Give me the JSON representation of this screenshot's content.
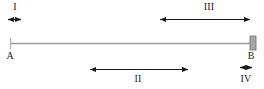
{
  "figure": {
    "type": "interval-diagram",
    "background_color": "#ffffff",
    "line_color": "#9a9a9a",
    "arrow_color": "#1a1a1a",
    "block_color": "#a8a8a8",
    "block_border_color": "#6e6e6e",
    "text_color": "#1a1a1a",
    "canvas": {
      "width": 264,
      "height": 89
    }
  },
  "rod": {
    "name": "main-rod",
    "start_label": "A",
    "end_label": "B",
    "start_x": 10,
    "end_x": 251,
    "y": 43,
    "end_block": {
      "name": "end-block",
      "x": 250,
      "y": 36,
      "width": 6,
      "height": 14
    },
    "start_tick": {
      "x": 10,
      "y_top": 38,
      "y_bottom": 49
    }
  },
  "intervals": [
    {
      "id": "I",
      "label": "I",
      "position": "above",
      "start_x": 7,
      "end_x": 22,
      "y": 19,
      "label_x": 15,
      "label_y": 7,
      "span_px": 15
    },
    {
      "id": "III",
      "label": "III",
      "position": "above",
      "start_x": 159,
      "end_x": 251,
      "y": 19,
      "label_x": 209,
      "label_y": 7,
      "span_px": 92
    },
    {
      "id": "II",
      "label": "II",
      "position": "below",
      "start_x": 89,
      "end_x": 189,
      "y": 69,
      "label_x": 138,
      "label_y": 79,
      "span_px": 100
    },
    {
      "id": "IV",
      "label": "IV",
      "position": "below",
      "start_x": 239,
      "end_x": 252,
      "y": 69,
      "label_x": 246,
      "label_y": 79,
      "span_px": 13
    }
  ],
  "labels": {
    "point_a": "A",
    "point_b": "B",
    "interval_1": "I",
    "interval_2": "II",
    "interval_3": "III",
    "interval_4": "IV"
  }
}
